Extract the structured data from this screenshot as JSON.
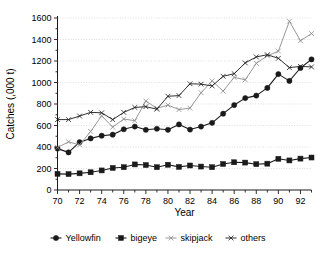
{
  "chart_data": {
    "type": "line",
    "title": "",
    "xlabel": "Year",
    "ylabel": "Catches (,000 t)",
    "xlim": [
      70,
      93
    ],
    "ylim": [
      0,
      1600
    ],
    "grid": true,
    "legend_position": "bottom",
    "x": [
      70,
      71,
      72,
      73,
      74,
      75,
      76,
      77,
      78,
      79,
      80,
      81,
      82,
      83,
      84,
      85,
      86,
      87,
      88,
      89,
      90,
      91,
      92,
      93
    ],
    "x_tick_labels": [
      "70",
      "72",
      "74",
      "76",
      "78",
      "80",
      "82",
      "84",
      "86",
      "88",
      "90",
      "92"
    ],
    "x_tick_values": [
      70,
      72,
      74,
      76,
      78,
      80,
      82,
      84,
      86,
      88,
      90,
      92
    ],
    "y_tick_labels": [
      "0",
      "200",
      "400",
      "600",
      "800",
      "1000",
      "1200",
      "1400",
      "1600"
    ],
    "y_tick_values": [
      0,
      200,
      400,
      600,
      800,
      1000,
      1200,
      1400,
      1600
    ],
    "series": [
      {
        "name": "Yellowfin",
        "marker": "filled-circle",
        "color": "#1a1a1a",
        "values": [
          385,
          350,
          445,
          480,
          505,
          515,
          565,
          590,
          560,
          570,
          560,
          610,
          562,
          590,
          625,
          710,
          790,
          855,
          878,
          950,
          1078,
          1015,
          1135,
          1215
        ]
      },
      {
        "name": "bigeye",
        "marker": "filled-square",
        "color": "#1a1a1a",
        "values": [
          150,
          148,
          155,
          165,
          182,
          205,
          212,
          238,
          232,
          212,
          235,
          215,
          228,
          218,
          212,
          242,
          258,
          255,
          240,
          245,
          290,
          275,
          292,
          302
        ]
      },
      {
        "name": "skipjack",
        "marker": "cross",
        "color": "#8c8c8c",
        "values": [
          395,
          448,
          420,
          545,
          690,
          585,
          660,
          645,
          828,
          760,
          790,
          748,
          762,
          905,
          1015,
          920,
          1048,
          1025,
          1178,
          1248,
          1292,
          1570,
          1388,
          1455
        ]
      },
      {
        "name": "others",
        "marker": "cross",
        "color": "#1a1a1a",
        "values": [
          655,
          655,
          688,
          722,
          718,
          655,
          722,
          768,
          775,
          752,
          872,
          878,
          988,
          985,
          968,
          1058,
          1082,
          1182,
          1238,
          1258,
          1225,
          1138,
          1150,
          1145
        ]
      }
    ]
  },
  "axes": {
    "x_title": "Year",
    "y_title": "Catches (,000 t)"
  },
  "legend": {
    "items": [
      {
        "label": "Yellowfin",
        "marker": "filled-circle",
        "color": "#1a1a1a"
      },
      {
        "label": "bigeye",
        "marker": "filled-square",
        "color": "#1a1a1a"
      },
      {
        "label": "skipjack",
        "marker": "cross",
        "color": "#8c8c8c"
      },
      {
        "label": "others",
        "marker": "cross",
        "color": "#1a1a1a"
      }
    ]
  }
}
